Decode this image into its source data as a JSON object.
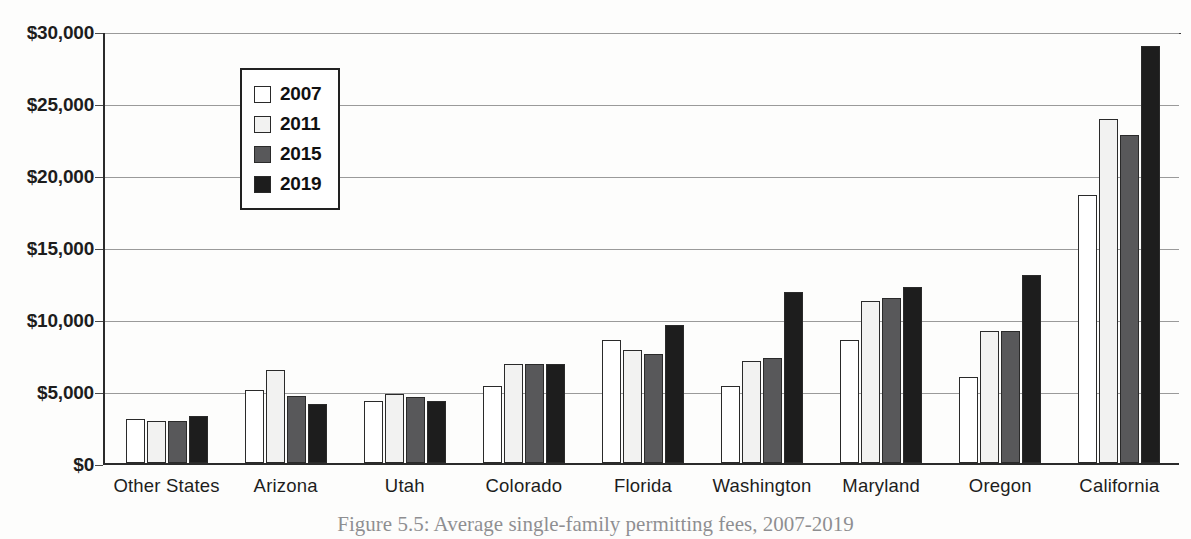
{
  "chart_data": {
    "type": "bar",
    "title": "",
    "xlabel": "",
    "ylabel": "",
    "ylim": [
      0,
      30000
    ],
    "ytick_step": 5000,
    "grid": true,
    "legend_position": "inside-upper-left",
    "categories": [
      "Other States",
      "Arizona",
      "Utah",
      "Colorado",
      "Florida",
      "Washington",
      "Maryland",
      "Oregon",
      "California"
    ],
    "ytick_labels": [
      "$0",
      "$5,000",
      "$10,000",
      "$15,000",
      "$20,000",
      "$25,000",
      "$30,000"
    ],
    "ytick_values": [
      0,
      5000,
      10000,
      15000,
      20000,
      25000,
      30000
    ],
    "series": [
      {
        "name": "2007",
        "color": "#ffffff",
        "values": [
          3100,
          5100,
          4300,
          5400,
          8600,
          5400,
          8600,
          6000,
          18700
        ]
      },
      {
        "name": "2011",
        "color": "#f2f2f1",
        "values": [
          2900,
          6500,
          4800,
          6900,
          7900,
          7100,
          11300,
          9200,
          24000
        ]
      },
      {
        "name": "2015",
        "color": "#58585a",
        "values": [
          2950,
          4700,
          4600,
          6900,
          7600,
          7300,
          11500,
          9200,
          22900
        ]
      },
      {
        "name": "2019",
        "color": "#1d1d1d",
        "values": [
          3300,
          4100,
          4300,
          6900,
          9600,
          11900,
          12300,
          13100,
          29100
        ]
      }
    ]
  },
  "legend": {
    "entries": [
      "2007",
      "2011",
      "2015",
      "2019"
    ]
  },
  "caption": {
    "text": "Figure 5.5: Average single-family permitting fees, 2007-2019"
  }
}
